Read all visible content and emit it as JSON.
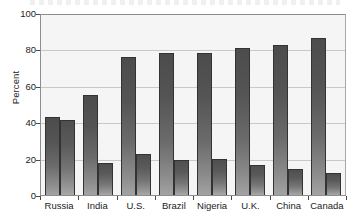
{
  "chart_data": {
    "type": "bar",
    "title": "",
    "subtitle": "",
    "xlabel": "",
    "ylabel": "Percent",
    "ylim": [
      0,
      100
    ],
    "yticks": [
      0,
      20,
      40,
      60,
      80,
      100
    ],
    "ytick_labels": [
      "0",
      "20",
      "40",
      "60",
      "80",
      "100"
    ],
    "grid": true,
    "legend": "none",
    "categories": [
      "Russia",
      "India",
      "U.S.",
      "Brazil",
      "Nigeria",
      "U.K.",
      "China",
      "Canada"
    ],
    "series": [
      {
        "name": "Series 1",
        "values": [
          43,
          55,
          76,
          78,
          78,
          81,
          82.5,
          86
        ]
      },
      {
        "name": "Series 2",
        "values": [
          41,
          17.5,
          22.5,
          19,
          20,
          16.5,
          14.5,
          12
        ]
      }
    ]
  },
  "axes": {
    "y_axis_title": "Percent"
  },
  "style": {
    "plot_background": "#f5f5f5",
    "figure_background": "#ffffff",
    "grid_color": "#c9c9c9",
    "axis_color": "#4a4a4a",
    "bar_color_top": "#4c4c4c",
    "bar_color_bottom": "#a3a3a3",
    "bar_border": "#333333",
    "text_color": "#1c1c1c"
  }
}
